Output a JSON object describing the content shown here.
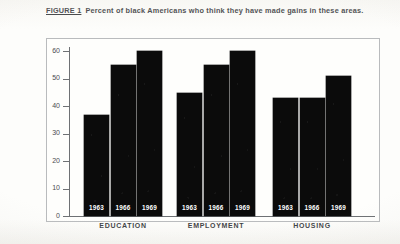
{
  "caption": {
    "figure_label": "FIGURE 1",
    "text": "Percent of black Americans who think they have made gains in these areas."
  },
  "chart_data": {
    "type": "bar",
    "title": "Percent of black Americans who think they have made gains in these areas.",
    "xlabel": "",
    "ylabel": "",
    "ylim": [
      0,
      62
    ],
    "yticks": [
      0,
      10,
      20,
      30,
      40,
      50,
      60
    ],
    "ytick_labels": [
      "0",
      "10",
      "20",
      "30",
      "40",
      "50",
      "60"
    ],
    "grid": false,
    "legend": "none",
    "bar_color": "#0b0b0b",
    "categories": [
      "EDUCATION",
      "EMPLOYMENT",
      "HOUSING"
    ],
    "series": [
      {
        "name": "1963",
        "values": [
          37,
          45,
          43
        ]
      },
      {
        "name": "1966",
        "values": [
          55,
          55,
          43
        ]
      },
      {
        "name": "1969",
        "values": [
          60,
          60,
          51
        ]
      }
    ],
    "groups": [
      {
        "label": "EDUCATION",
        "bars": [
          {
            "year": "1963",
            "value": 37
          },
          {
            "year": "1966",
            "value": 55
          },
          {
            "year": "1969",
            "value": 60
          }
        ]
      },
      {
        "label": "EMPLOYMENT",
        "bars": [
          {
            "year": "1963",
            "value": 45
          },
          {
            "year": "1966",
            "value": 55
          },
          {
            "year": "1969",
            "value": 60
          }
        ]
      },
      {
        "label": "HOUSING",
        "bars": [
          {
            "year": "1963",
            "value": 43
          },
          {
            "year": "1966",
            "value": 43
          },
          {
            "year": "1969",
            "value": 51
          }
        ]
      }
    ]
  }
}
